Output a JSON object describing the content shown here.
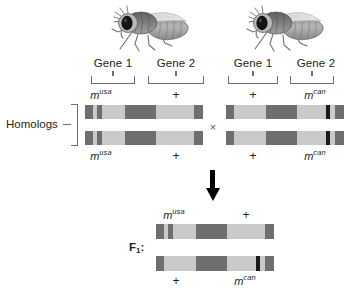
{
  "figure": {
    "type": "genetics-cross-diagram",
    "organism": "fruit fly",
    "homologs_label": "Homologs",
    "cross_symbol": "×",
    "f1_label_text": "F",
    "f1_label_sub": "1",
    "f1_label_colon": ":"
  },
  "parents": [
    {
      "id": "parent-left",
      "genes": [
        {
          "name": "Gene 1",
          "allele_base": "m",
          "allele_sup": "usa",
          "allele_is_wildtype": false
        },
        {
          "name": "Gene 2",
          "allele_base": "+",
          "allele_sup": "",
          "allele_is_wildtype": true
        }
      ],
      "lower_alleles": [
        {
          "allele_base": "m",
          "allele_sup": "usa",
          "allele_is_wildtype": false
        },
        {
          "allele_base": "+",
          "allele_sup": "",
          "allele_is_wildtype": true
        }
      ]
    },
    {
      "id": "parent-right",
      "genes": [
        {
          "name": "Gene 1",
          "allele_base": "+",
          "allele_sup": "",
          "allele_is_wildtype": true
        },
        {
          "name": "Gene 2",
          "allele_base": "m",
          "allele_sup": "can",
          "allele_is_wildtype": false
        }
      ],
      "lower_alleles": [
        {
          "allele_base": "+",
          "allele_sup": "",
          "allele_is_wildtype": true
        },
        {
          "allele_base": "m",
          "allele_sup": "can",
          "allele_is_wildtype": false
        }
      ]
    }
  ],
  "f1": {
    "top_alleles": [
      {
        "allele_base": "m",
        "allele_sup": "usa",
        "allele_is_wildtype": false
      },
      {
        "allele_base": "+",
        "allele_sup": "",
        "allele_is_wildtype": true
      }
    ],
    "bottom_alleles": [
      {
        "allele_base": "+",
        "allele_sup": "",
        "allele_is_wildtype": true
      },
      {
        "allele_base": "m",
        "allele_sup": "can",
        "allele_is_wildtype": false
      }
    ]
  },
  "chromosome_patterns": {
    "usa_type": [
      {
        "left_pct": 0.0,
        "width_pct": 7.0,
        "shade": "b-dark"
      },
      {
        "left_pct": 10.5,
        "width_pct": 4.0,
        "shade": "b-dark"
      },
      {
        "left_pct": 34.0,
        "width_pct": 26.0,
        "shade": "b-dark"
      },
      {
        "left_pct": 92.5,
        "width_pct": 7.5,
        "shade": "b-dark"
      }
    ],
    "can_type": [
      {
        "left_pct": 0.0,
        "width_pct": 7.0,
        "shade": "b-dark"
      },
      {
        "left_pct": 34.0,
        "width_pct": 26.0,
        "shade": "b-dark"
      },
      {
        "left_pct": 85.0,
        "width_pct": 3.0,
        "shade": "b-black"
      },
      {
        "left_pct": 92.5,
        "width_pct": 7.5,
        "shade": "b-dark"
      }
    ]
  },
  "colors": {
    "chromosome_base": "#c9c9c9",
    "band_dark": "#6e6e6e",
    "band_black": "#1a1a1a",
    "line": "#6d6e71",
    "text": "#231f20",
    "arrow": "#000000"
  }
}
